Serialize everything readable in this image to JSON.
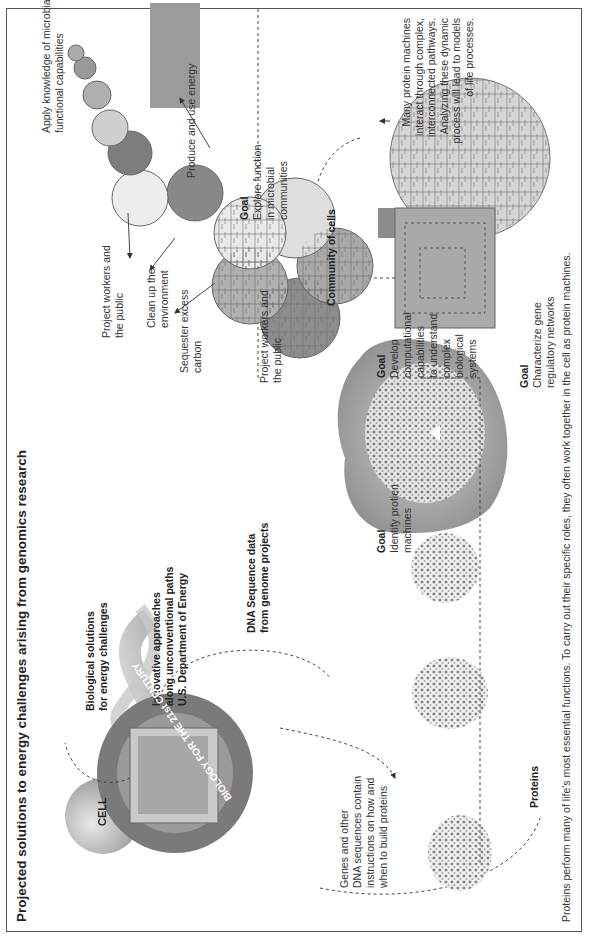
{
  "title": "Projected solutions to energy challenges arising from genomics research",
  "caption": "Proteins perform many of life's most essential functions. To carry out their specific roles, they often work together in the cell as protein machines.",
  "colors": {
    "frame": "#555555",
    "text": "#333333",
    "circle_dark": "#8a8a8a",
    "circle_mid": "#b4b4b4",
    "circle_light": "#e2e2e2"
  },
  "left_section": {
    "cell_label": "CELL",
    "biological_solutions": [
      "Biological solutions",
      "for energy challenges"
    ],
    "innovative": [
      "Innovative approaches",
      "along unconventional paths",
      "U.S. Department of Energy"
    ],
    "dna_sequence": [
      "DNA Sequence data",
      "from genome projects"
    ],
    "monitor_ring_text": "BIOLOGY FOR THE 21st CENTURY",
    "genes_note": [
      "Genes and other",
      "DNA sequences contain",
      "instructions on how and",
      "when to build proteins"
    ],
    "proteins_label": "Proteins"
  },
  "protein_machines": {
    "goal_label": "Goal",
    "goal_text": [
      "Identify protien",
      "machines"
    ]
  },
  "community": {
    "outcomes": [
      {
        "label": [
          "Project workers and",
          "the public"
        ]
      },
      {
        "label": [
          "Clean up the",
          "environment"
        ]
      },
      {
        "label": [
          "Sequester excess",
          "carbon"
        ]
      },
      {
        "label": [
          "Project workers and",
          "the public"
        ]
      },
      {
        "label": [
          "Produce and use energy"
        ]
      },
      {
        "label": [
          "Apply knowledge of microbial",
          "functional capabilities"
        ]
      }
    ],
    "goal_label": "Goal",
    "goal_text": [
      "Explore function",
      "in microbial",
      "communities"
    ],
    "community_label": "Community of cells"
  },
  "networks": {
    "goal1_label": "Goal",
    "goal1_text": [
      "Develop",
      "computational",
      "capabilities",
      "to understand",
      "complex",
      "biological",
      "systems"
    ],
    "goal2_label": "Goal",
    "goal2_text": [
      "Characterize gene",
      "regulatory networks"
    ],
    "note": [
      "Many protein machines",
      "interact through complex,",
      "interconnected pathways.",
      "Analyzing these dynamic",
      "process will lead to models",
      "of life processes."
    ]
  }
}
